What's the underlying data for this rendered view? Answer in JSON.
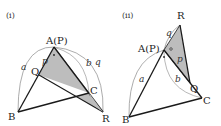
{
  "panels": [
    {
      "id": "i",
      "label": "(i)",
      "vertices": {
        "A": "A(P)",
        "B": "B",
        "C": "C",
        "Q": "Q",
        "R": "R"
      },
      "sides": {
        "a": "a",
        "b": "b",
        "p": "p",
        "q": "q"
      }
    },
    {
      "id": "ii",
      "label": "(ii)",
      "vertices": {
        "A": "A(P)",
        "B": "B",
        "C": "C",
        "Q": "Q",
        "R": "R"
      },
      "sides": {
        "a": "a",
        "b": "b",
        "p": "p",
        "q": "q"
      }
    }
  ],
  "colors": {
    "shade": "#bdbdbd",
    "line": "#1a1a1a",
    "arc": "#888888"
  }
}
